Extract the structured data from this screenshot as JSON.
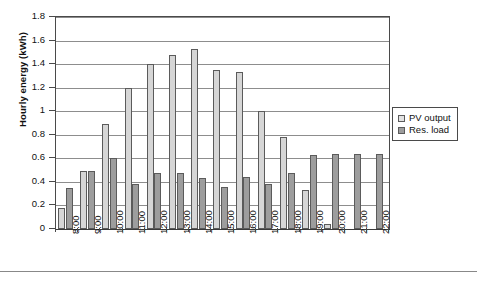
{
  "chart_data": {
    "type": "bar",
    "title": "",
    "xlabel": "",
    "ylabel": "Hourly energy (kWh)",
    "ylim": [
      0,
      1.8
    ],
    "ytick_step": 0.2,
    "yticks": [
      "0",
      "0.2",
      "0.4",
      "0.6",
      "0.8",
      "1",
      "1.2",
      "1.4",
      "1.6",
      "1.8"
    ],
    "grid": true,
    "legend_position": "right",
    "categories": [
      "8:00",
      "9:00",
      "10:00",
      "11:00",
      "12:00",
      "13:00",
      "14:00",
      "15:00",
      "16:00",
      "17:00",
      "18:00",
      "19:00",
      "20:00",
      "21:00",
      "22:00"
    ],
    "series": [
      {
        "name": "PV output",
        "color": "#d6d6d6",
        "values": [
          0.18,
          0.49,
          0.89,
          1.2,
          1.4,
          1.48,
          1.53,
          1.35,
          1.33,
          1.0,
          0.78,
          0.33,
          0.04,
          0,
          0
        ]
      },
      {
        "name": "Res. load",
        "color": "#9d9d9d",
        "values": [
          0.35,
          0.49,
          0.6,
          0.38,
          0.48,
          0.48,
          0.43,
          0.36,
          0.44,
          0.38,
          0.48,
          0.63,
          0.64,
          0.64,
          0.64
        ]
      }
    ]
  },
  "legend": {
    "items": [
      {
        "label": "PV output"
      },
      {
        "label": "Res. load"
      }
    ]
  },
  "axis": {
    "y_title": "Hourly energy (kWh)"
  }
}
